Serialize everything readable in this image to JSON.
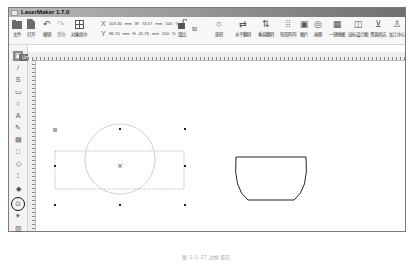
{
  "window": {
    "title": "LaserMaker 1.7.0"
  },
  "toolbar": {
    "buttons": [
      {
        "label": "文件",
        "icon": "folder-icon"
      },
      {
        "label": "打开",
        "icon": "open-file-icon"
      },
      {
        "label": "撤销",
        "icon": "undo-icon"
      },
      {
        "label": "重做",
        "icon": "redo-icon"
      },
      {
        "label": "对象居中",
        "icon": "center-object-icon"
      }
    ],
    "coords": {
      "x_label": "X",
      "x_value": "103.30",
      "x_unit": "mm",
      "w_label": "W",
      "w_value": "74.57",
      "w_unit": "mm",
      "w_percent": "100",
      "y_label": "Y",
      "y_value": "86.74",
      "y_unit": "mm",
      "h_label": "H",
      "h_value": "41.76",
      "h_unit": "mm",
      "h_percent": "100",
      "percent_sign": "%"
    },
    "lock_label": "锁比",
    "rotate_value": "90",
    "right_buttons": [
      {
        "label": "旋转",
        "icon": "rotate-icon"
      },
      {
        "label": "水平翻转",
        "icon": "flip-horizontal-icon"
      },
      {
        "label": "垂直翻转",
        "icon": "flip-vertical-icon"
      },
      {
        "label": "矩形阵列",
        "icon": "array-icon"
      },
      {
        "label": "图片",
        "icon": "image-icon"
      },
      {
        "label": "画册",
        "icon": "gallery-icon"
      },
      {
        "label": "一键做图",
        "icon": "one-click-icon"
      },
      {
        "label": "鼠标设计图",
        "icon": "design-icon"
      },
      {
        "label": "资源商店",
        "icon": "store-icon"
      },
      {
        "label": "加工中心",
        "icon": "process-icon"
      }
    ]
  },
  "tabs": [
    {
      "label": "Untitled.lzr",
      "close": "×"
    }
  ],
  "sidebar": {
    "tools": [
      {
        "name": "select-tool",
        "glyph": "▣"
      },
      {
        "name": "line-tool",
        "glyph": "/"
      },
      {
        "name": "curve-tool",
        "glyph": "S"
      },
      {
        "name": "rectangle-tool",
        "glyph": "▭"
      },
      {
        "name": "ellipse-tool",
        "glyph": "○"
      },
      {
        "name": "text-tool",
        "glyph": "A"
      },
      {
        "name": "pen-tool",
        "glyph": "✎"
      },
      {
        "name": "image-tool",
        "glyph": "▤"
      },
      {
        "name": "shape-tool",
        "glyph": "□"
      },
      {
        "name": "polygon-tool",
        "glyph": "◇"
      },
      {
        "name": "align-tool",
        "glyph": "⌶"
      },
      {
        "name": "fill-tool",
        "glyph": "◆"
      },
      {
        "name": "weld-tool",
        "glyph": "⊙"
      },
      {
        "name": "node-tool",
        "glyph": "▾"
      },
      {
        "name": "layer-tool",
        "glyph": "▥"
      }
    ]
  },
  "canvas": {
    "objects": [
      {
        "type": "circle",
        "selected": true
      },
      {
        "type": "bowl-shape",
        "selected": false
      }
    ]
  },
  "caption": "图 1-1-27 边框弧形"
}
